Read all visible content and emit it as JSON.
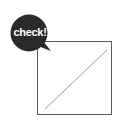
{
  "bubble": {
    "label": "check!",
    "color": "#2a2a2a",
    "text_color": "#ffffff"
  },
  "checkbox": {
    "border_color": "#5a5a5a",
    "line_color": "#9a9a9a",
    "state": "slash"
  }
}
